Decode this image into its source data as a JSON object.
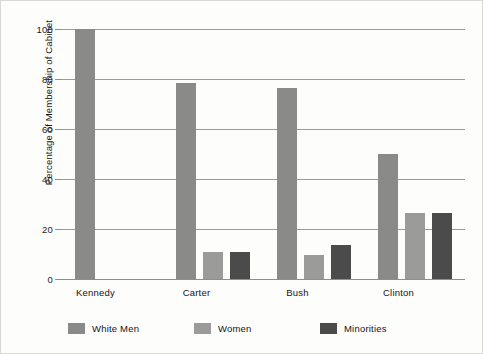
{
  "chart_data": {
    "type": "bar",
    "title": "",
    "xlabel": "",
    "ylabel": "Percentage of Membership of Cabinet",
    "ylim": [
      0,
      100
    ],
    "yticks": [
      0,
      20,
      40,
      60,
      80,
      100
    ],
    "grid": true,
    "legend_position": "bottom-left",
    "categories": [
      "Kennedy",
      "Carter",
      "Bush",
      "Clinton"
    ],
    "series": [
      {
        "name": "White Men",
        "color": "#8a8a88",
        "values": [
          100,
          78.5,
          76.5,
          50
        ]
      },
      {
        "name": "Women",
        "color": "#9b9b99",
        "values": [
          0,
          11,
          9.5,
          26.5
        ]
      },
      {
        "name": "Minorities",
        "color": "#4b4b4b",
        "values": [
          0,
          11,
          13.5,
          26.5
        ]
      }
    ]
  }
}
